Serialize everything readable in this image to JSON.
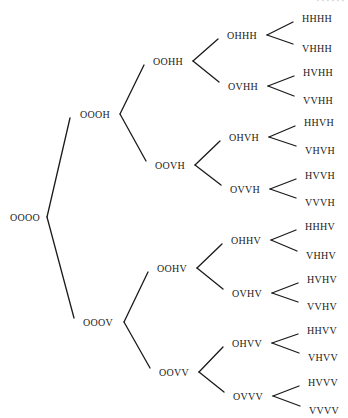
{
  "diagram": {
    "type": "tree",
    "orientation": "left-to-right",
    "corner_fragment": "· · · · · ·",
    "root": {
      "id": "n0",
      "label": "OOOO",
      "x": 10,
      "y": 217,
      "vx": 47
    },
    "nodes": [
      {
        "id": "n1",
        "label": "OOOH",
        "x": 80,
        "y": 114,
        "vx": 120,
        "parent": "n0",
        "lx": 70
      },
      {
        "id": "n2",
        "label": "OOOV",
        "x": 83,
        "y": 322,
        "vx": 124,
        "parent": "n0",
        "lx": 74
      },
      {
        "id": "n3",
        "label": "OOHH",
        "x": 153,
        "y": 61,
        "vx": 193,
        "parent": "n1",
        "lx": 144
      },
      {
        "id": "n4",
        "label": "OOVH",
        "x": 155,
        "y": 165,
        "vx": 195,
        "parent": "n1",
        "lx": 146
      },
      {
        "id": "n5",
        "label": "OOHV",
        "x": 157,
        "y": 268,
        "vx": 197,
        "parent": "n2",
        "lx": 148
      },
      {
        "id": "n6",
        "label": "OOVV",
        "x": 159,
        "y": 372,
        "vx": 199,
        "parent": "n2",
        "lx": 150
      },
      {
        "id": "n7",
        "label": "OHHH",
        "x": 227,
        "y": 35,
        "vx": 267,
        "parent": "n3",
        "lx": 218
      },
      {
        "id": "n8",
        "label": "OVHH",
        "x": 228,
        "y": 86,
        "vx": 268,
        "parent": "n3",
        "lx": 219
      },
      {
        "id": "n9",
        "label": "OHVH",
        "x": 229,
        "y": 137,
        "vx": 269,
        "parent": "n4",
        "lx": 220
      },
      {
        "id": "n10",
        "label": "OVVH",
        "x": 230,
        "y": 189,
        "vx": 270,
        "parent": "n4",
        "lx": 221
      },
      {
        "id": "n11",
        "label": "OHHV",
        "x": 231,
        "y": 240,
        "vx": 271,
        "parent": "n5",
        "lx": 222
      },
      {
        "id": "n12",
        "label": "OVHV",
        "x": 232,
        "y": 293,
        "vx": 272,
        "parent": "n5",
        "lx": 223
      },
      {
        "id": "n13",
        "label": "OHVV",
        "x": 232,
        "y": 343,
        "vx": 272,
        "parent": "n6",
        "lx": 223
      },
      {
        "id": "n14",
        "label": "OVVV",
        "x": 233,
        "y": 396,
        "vx": 273,
        "parent": "n6",
        "lx": 224
      },
      {
        "id": "l1",
        "label": "HHHH",
        "x": 302,
        "y": 18,
        "parent": "n7",
        "lx": 293
      },
      {
        "id": "l2",
        "label": "VHHH",
        "x": 302,
        "y": 48,
        "parent": "n7",
        "lx": 293
      },
      {
        "id": "l3",
        "label": "HVHH",
        "x": 303,
        "y": 72,
        "parent": "n8",
        "lx": 294
      },
      {
        "id": "l4",
        "label": "VVHH",
        "x": 303,
        "y": 100,
        "parent": "n8",
        "lx": 294
      },
      {
        "id": "l5",
        "label": "HHVH",
        "x": 304,
        "y": 122,
        "parent": "n9",
        "lx": 295
      },
      {
        "id": "l6",
        "label": "VHVH",
        "x": 305,
        "y": 150,
        "parent": "n9",
        "lx": 296
      },
      {
        "id": "l7",
        "label": "HVVH",
        "x": 305,
        "y": 175,
        "parent": "n10",
        "lx": 296
      },
      {
        "id": "l8",
        "label": "VVVH",
        "x": 305,
        "y": 202,
        "parent": "n10",
        "lx": 296
      },
      {
        "id": "l9",
        "label": "HHHV",
        "x": 305,
        "y": 226,
        "parent": "n11",
        "lx": 296
      },
      {
        "id": "l10",
        "label": "VHHV",
        "x": 306,
        "y": 255,
        "parent": "n11",
        "lx": 297
      },
      {
        "id": "l11",
        "label": "HVHV",
        "x": 307,
        "y": 279,
        "parent": "n12",
        "lx": 298
      },
      {
        "id": "l12",
        "label": "VVHV",
        "x": 307,
        "y": 306,
        "parent": "n12",
        "lx": 298
      },
      {
        "id": "l13",
        "label": "HHVV",
        "x": 307,
        "y": 330,
        "parent": "n13",
        "lx": 298
      },
      {
        "id": "l14",
        "label": "VHVV",
        "x": 308,
        "y": 357,
        "parent": "n13",
        "lx": 299
      },
      {
        "id": "l15",
        "label": "HVVV",
        "x": 308,
        "y": 382,
        "parent": "n14",
        "lx": 299
      },
      {
        "id": "l16",
        "label": "VVVV",
        "x": 309,
        "y": 410,
        "parent": "n14",
        "lx": 300
      }
    ]
  }
}
